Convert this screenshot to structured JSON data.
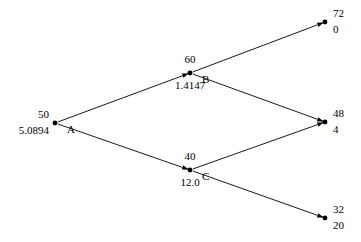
{
  "diagram": {
    "type": "binomial-lattice",
    "nodes": [
      {
        "id": "A",
        "name": "A",
        "stock_price": "50",
        "option_value": "5.0894",
        "x": 55,
        "y": 123,
        "label_side": "left"
      },
      {
        "id": "B",
        "name": "B",
        "stock_price": "60",
        "option_value": "1.4147",
        "x": 190,
        "y": 73,
        "label_side": "center"
      },
      {
        "id": "C",
        "name": "C",
        "stock_price": "40",
        "option_value": "12.0",
        "x": 190,
        "y": 170,
        "label_side": "center"
      },
      {
        "id": "D",
        "name": "",
        "stock_price": "72",
        "option_value": "0",
        "x": 325,
        "y": 22,
        "label_side": "right"
      },
      {
        "id": "E",
        "name": "",
        "stock_price": "48",
        "option_value": "4",
        "x": 325,
        "y": 122,
        "label_side": "right"
      },
      {
        "id": "F",
        "name": "",
        "stock_price": "32",
        "option_value": "20",
        "x": 325,
        "y": 218,
        "label_side": "right"
      }
    ],
    "edges": [
      {
        "from": "A",
        "to": "B"
      },
      {
        "from": "A",
        "to": "C"
      },
      {
        "from": "B",
        "to": "D"
      },
      {
        "from": "B",
        "to": "E"
      },
      {
        "from": "C",
        "to": "E"
      },
      {
        "from": "C",
        "to": "F"
      }
    ],
    "colors": {
      "line": "#000000",
      "node": "#000000",
      "text": "#000000",
      "background": "#ffffff"
    }
  }
}
